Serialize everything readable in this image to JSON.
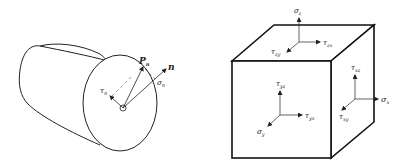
{
  "figure": {
    "left_panel": {
      "description": "cylinder cross-section with traction vector on oblique plane",
      "labels": {
        "traction": {
          "main": "P",
          "sub": "n"
        },
        "normal": {
          "main": "n",
          "sub": ""
        },
        "normal_stress": {
          "main": "σ",
          "sub": "n"
        },
        "shear_stress": {
          "main": "τ",
          "sub": "n"
        }
      }
    },
    "right_panel": {
      "description": "stress element cube with stress components on three faces",
      "top_face": {
        "normal": {
          "main": "σ",
          "sub": "z"
        },
        "shear_1": {
          "main": "τ",
          "sub": "zx"
        },
        "shear_2": {
          "main": "τ",
          "sub": "zy"
        }
      },
      "right_face": {
        "normal": {
          "main": "σ",
          "sub": "x"
        },
        "shear_1": {
          "main": "τ",
          "sub": "xz"
        },
        "shear_2": {
          "main": "τ",
          "sub": "xy"
        }
      },
      "front_face": {
        "normal": {
          "main": "σ",
          "sub": "y"
        },
        "shear_1": {
          "main": "τ",
          "sub": "yz"
        },
        "shear_2": {
          "main": "τ",
          "sub": "yx"
        }
      }
    },
    "colors": {
      "stroke": "#222222",
      "background": "#ffffff"
    }
  }
}
